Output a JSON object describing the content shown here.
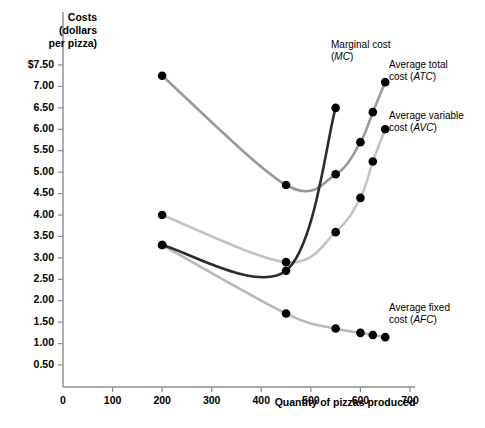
{
  "chart_data": {
    "type": "line",
    "title": "",
    "ylabel": "Costs (dollars per pizza)",
    "ylabel_lines": [
      "Costs",
      "(dollars",
      "per pizza)"
    ],
    "xlabel": "Quantity of pizzas produced",
    "xlim": [
      0,
      700
    ],
    "ylim": [
      0,
      7.75
    ],
    "grid": false,
    "legend_position": "inline-curve-labels",
    "x_ticks": [
      0,
      100,
      200,
      300,
      400,
      500,
      600,
      700
    ],
    "x_tick_labels": [
      "0",
      "100",
      "200",
      "300",
      "400",
      "500",
      "600",
      "700"
    ],
    "y_ticks": [
      0.5,
      1.0,
      1.5,
      2.0,
      2.5,
      3.0,
      3.5,
      4.0,
      4.5,
      5.0,
      5.5,
      6.0,
      6.5,
      7.0,
      7.5
    ],
    "y_tick_labels": [
      "0.50",
      "1.00",
      "1.50",
      "2.00",
      "2.50",
      "3.00",
      "3.50",
      "4.00",
      "4.50",
      "5.00",
      "5.50",
      "6.00",
      "6.50",
      "7.00",
      "$7.50"
    ],
    "series": [
      {
        "name": "Average total cost (ATC)",
        "abbr": "ATC",
        "label_line1": "Average total",
        "label_line2_prefix": "cost (",
        "label_line2_suffix": ")",
        "color": "#9a9a9a",
        "width": 2.6,
        "points": [
          {
            "x": 200,
            "y": 7.25
          },
          {
            "x": 450,
            "y": 4.7
          },
          {
            "x": 550,
            "y": 4.95
          },
          {
            "x": 600,
            "y": 5.7
          },
          {
            "x": 625,
            "y": 6.4
          },
          {
            "x": 650,
            "y": 7.1
          }
        ]
      },
      {
        "name": "Average variable cost (AVC)",
        "abbr": "AVC",
        "label_line1": "Average variable",
        "label_line2_prefix": "cost (",
        "label_line2_suffix": ")",
        "color": "#c4c4c4",
        "width": 2.6,
        "points": [
          {
            "x": 200,
            "y": 4.0
          },
          {
            "x": 450,
            "y": 2.9
          },
          {
            "x": 550,
            "y": 3.6
          },
          {
            "x": 600,
            "y": 4.4
          },
          {
            "x": 625,
            "y": 5.25
          },
          {
            "x": 650,
            "y": 6.0
          }
        ]
      },
      {
        "name": "Marginal cost (MC)",
        "abbr": "MC",
        "label_line1": "Marginal cost",
        "label_line2_prefix": "(",
        "label_line2_suffix": ")",
        "color": "#2b2b2b",
        "width": 2.6,
        "points": [
          {
            "x": 200,
            "y": 3.3
          },
          {
            "x": 450,
            "y": 2.7
          },
          {
            "x": 550,
            "y": 6.5
          }
        ]
      },
      {
        "name": "Average fixed cost (AFC)",
        "abbr": "AFC",
        "label_line1": "Average fixed",
        "label_line2_prefix": "cost (",
        "label_line2_suffix": ")",
        "color": "#b9b9b9",
        "width": 2.6,
        "points": [
          {
            "x": 200,
            "y": 3.3
          },
          {
            "x": 450,
            "y": 1.7
          },
          {
            "x": 550,
            "y": 1.35
          },
          {
            "x": 600,
            "y": 1.25
          },
          {
            "x": 625,
            "y": 1.2
          },
          {
            "x": 650,
            "y": 1.15
          }
        ]
      }
    ]
  },
  "axes": {
    "y_title_line1": "Costs",
    "y_title_line2": "(dollars",
    "y_title_line3": "per pizza)",
    "x_title": "Quantity of pizzas produced"
  }
}
